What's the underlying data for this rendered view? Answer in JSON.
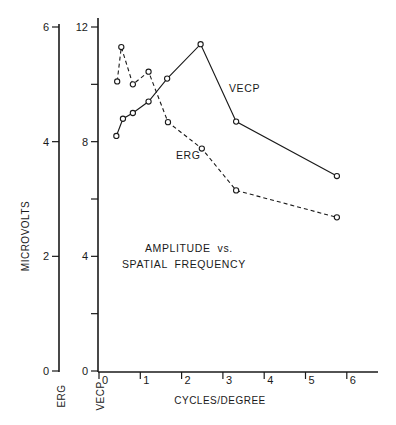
{
  "chart_data": {
    "type": "line",
    "title": "AMPLITUDE vs. SPATIAL FREQUENCY",
    "title_lines": [
      "AMPLITUDE  vs.",
      "SPATIAL  FREQUENCY"
    ],
    "xlabel": "CYCLES/DEGREE",
    "ylabel": "MICROVOLTS",
    "xlim": [
      0,
      6.5
    ],
    "x_ticks": [
      0,
      1,
      2,
      3,
      4,
      5,
      6
    ],
    "grid": false,
    "legend": "inline labels",
    "axes": [
      {
        "name": "ERG",
        "label": "ERG",
        "ylim": [
          0,
          6
        ],
        "major_ticks": [
          0,
          2,
          4,
          6
        ],
        "minor_ticks": []
      },
      {
        "name": "VECP",
        "label": "VECP",
        "ylim": [
          0,
          12
        ],
        "major_ticks": [
          0,
          4,
          8,
          12
        ],
        "minor_ticks": [
          2,
          6,
          10
        ]
      }
    ],
    "series": [
      {
        "name": "VECP",
        "axis": "VECP",
        "line_style": "solid",
        "marker": "open-circle",
        "x": [
          0.42,
          0.58,
          0.82,
          1.2,
          1.65,
          2.46,
          3.32,
          5.76
        ],
        "values": [
          8.2,
          8.8,
          9.0,
          9.4,
          10.2,
          11.4,
          8.7,
          6.8
        ]
      },
      {
        "name": "ERG",
        "axis": "ERG",
        "line_style": "dashed",
        "marker": "open-circle",
        "x": [
          0.44,
          0.54,
          0.82,
          1.2,
          1.67,
          2.49,
          3.32,
          5.76
        ],
        "values": [
          5.05,
          5.65,
          5.0,
          5.22,
          4.34,
          3.88,
          3.15,
          2.68
        ]
      }
    ],
    "annotations": [
      {
        "text": "VECP",
        "near_series": "VECP"
      },
      {
        "text": "ERG",
        "near_series": "ERG"
      }
    ]
  }
}
